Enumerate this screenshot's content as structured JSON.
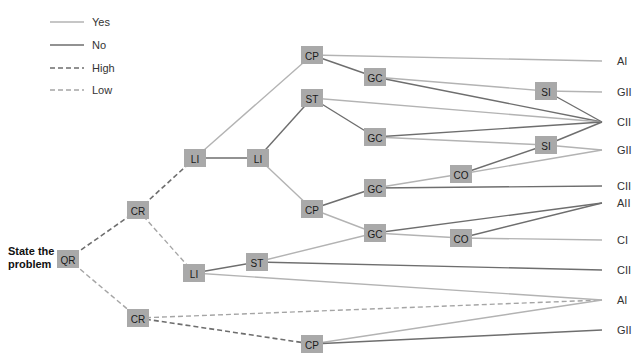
{
  "colors": {
    "yes": "#b3b3b3",
    "no": "#6e6e6e",
    "high": "#6e6e6e",
    "low": "#a5a5a5",
    "node_fill": "#a9a9a9",
    "text": "#333333"
  },
  "legend": [
    {
      "label": "Yes",
      "style": "yes",
      "y": 22
    },
    {
      "label": "No",
      "style": "no",
      "y": 45
    },
    {
      "label": "High",
      "style": "high",
      "y": 68
    },
    {
      "label": "Low",
      "style": "low",
      "y": 90
    }
  ],
  "root_label": [
    "State the",
    "problem"
  ],
  "nodes": [
    {
      "id": "QR",
      "label": "QR",
      "x": 68,
      "y": 259
    },
    {
      "id": "CR1",
      "label": "CR",
      "x": 138,
      "y": 210
    },
    {
      "id": "CR2",
      "label": "CR",
      "x": 138,
      "y": 318
    },
    {
      "id": "LI1",
      "label": "LI",
      "x": 195,
      "y": 158
    },
    {
      "id": "LI2",
      "label": "LI",
      "x": 258,
      "y": 158
    },
    {
      "id": "LI3",
      "label": "LI",
      "x": 194,
      "y": 273
    },
    {
      "id": "CP1",
      "label": "CP",
      "x": 312,
      "y": 55
    },
    {
      "id": "ST1",
      "label": "ST",
      "x": 312,
      "y": 98
    },
    {
      "id": "CP2",
      "label": "CP",
      "x": 312,
      "y": 209
    },
    {
      "id": "ST2",
      "label": "ST",
      "x": 257,
      "y": 262
    },
    {
      "id": "CP3",
      "label": "CP",
      "x": 312,
      "y": 344
    },
    {
      "id": "GC1",
      "label": "GC",
      "x": 375,
      "y": 77
    },
    {
      "id": "GC2",
      "label": "GC",
      "x": 375,
      "y": 137
    },
    {
      "id": "GC3",
      "label": "GC",
      "x": 375,
      "y": 188
    },
    {
      "id": "GC4",
      "label": "GC",
      "x": 375,
      "y": 233
    },
    {
      "id": "CO1",
      "label": "CO",
      "x": 461,
      "y": 174
    },
    {
      "id": "CO2",
      "label": "CO",
      "x": 461,
      "y": 238
    },
    {
      "id": "SI1",
      "label": "SI",
      "x": 546,
      "y": 91
    },
    {
      "id": "SI2",
      "label": "SI",
      "x": 546,
      "y": 145
    }
  ],
  "terminals": [
    {
      "id": "T1",
      "label": "AI",
      "x": 608,
      "y": 61
    },
    {
      "id": "T2",
      "label": "GII",
      "x": 608,
      "y": 92
    },
    {
      "id": "T3",
      "label": "CII",
      "x": 608,
      "y": 122
    },
    {
      "id": "T4",
      "label": "GII",
      "x": 608,
      "y": 150
    },
    {
      "id": "T5",
      "label": "CII",
      "x": 608,
      "y": 186
    },
    {
      "id": "T6",
      "label": "AII",
      "x": 608,
      "y": 203
    },
    {
      "id": "T7",
      "label": "CI",
      "x": 608,
      "y": 240
    },
    {
      "id": "T8",
      "label": "CII",
      "x": 608,
      "y": 270
    },
    {
      "id": "T9",
      "label": "AI",
      "x": 608,
      "y": 300
    },
    {
      "id": "T10",
      "label": "GII",
      "x": 608,
      "y": 330
    }
  ],
  "edges": [
    {
      "from": "QR",
      "to": "CR1",
      "type": "high"
    },
    {
      "from": "QR",
      "to": "CR2",
      "type": "low"
    },
    {
      "from": "CR1",
      "to": "LI1",
      "type": "high"
    },
    {
      "from": "CR1",
      "to": "LI3",
      "type": "low"
    },
    {
      "from": "CR2",
      "to": "T9",
      "type": "low"
    },
    {
      "from": "CR2",
      "to": "CP3",
      "type": "high"
    },
    {
      "from": "LI1",
      "to": "CP1",
      "type": "yes"
    },
    {
      "from": "LI1",
      "to": "LI2",
      "type": "no"
    },
    {
      "from": "LI2",
      "to": "ST1",
      "type": "no"
    },
    {
      "from": "LI2",
      "to": "CP2",
      "type": "yes"
    },
    {
      "from": "CP1",
      "to": "T1",
      "type": "yes"
    },
    {
      "from": "CP1",
      "to": "GC1",
      "type": "no"
    },
    {
      "from": "GC1",
      "to": "SI1",
      "type": "yes"
    },
    {
      "from": "GC1",
      "to": "T3",
      "type": "no"
    },
    {
      "from": "SI1",
      "to": "T2",
      "type": "yes"
    },
    {
      "from": "SI1",
      "to": "T3",
      "type": "no"
    },
    {
      "from": "ST1",
      "to": "T3",
      "type": "yes"
    },
    {
      "from": "ST1",
      "to": "GC2",
      "type": "no"
    },
    {
      "from": "GC2",
      "to": "T3",
      "type": "no"
    },
    {
      "from": "GC2",
      "to": "SI2",
      "type": "yes"
    },
    {
      "from": "SI2",
      "to": "T4",
      "type": "yes"
    },
    {
      "from": "SI2",
      "to": "T3",
      "type": "no"
    },
    {
      "from": "CP2",
      "to": "GC3",
      "type": "no"
    },
    {
      "from": "CP2",
      "to": "GC4",
      "type": "yes"
    },
    {
      "from": "GC3",
      "to": "CO1",
      "type": "yes"
    },
    {
      "from": "GC3",
      "to": "T5",
      "type": "no"
    },
    {
      "from": "CO1",
      "to": "SI2",
      "type": "no"
    },
    {
      "from": "CO1",
      "to": "T4",
      "type": "yes"
    },
    {
      "from": "LI3",
      "to": "ST2",
      "type": "no"
    },
    {
      "from": "LI3",
      "to": "T9",
      "type": "yes"
    },
    {
      "from": "ST2",
      "to": "GC4",
      "type": "yes"
    },
    {
      "from": "ST2",
      "to": "T8",
      "type": "no"
    },
    {
      "from": "GC4",
      "to": "T6",
      "type": "no"
    },
    {
      "from": "GC4",
      "to": "CO2",
      "type": "yes"
    },
    {
      "from": "CO2",
      "to": "T6",
      "type": "no"
    },
    {
      "from": "CO2",
      "to": "T7",
      "type": "yes"
    },
    {
      "from": "CP3",
      "to": "T9",
      "type": "yes"
    },
    {
      "from": "CP3",
      "to": "T10",
      "type": "no"
    }
  ]
}
